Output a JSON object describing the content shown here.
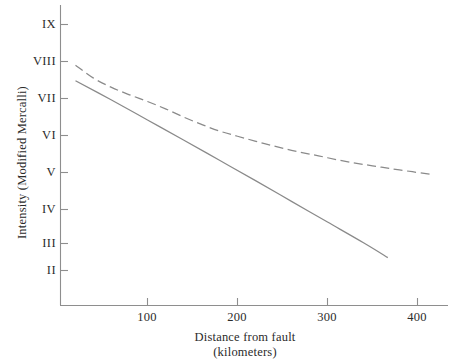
{
  "chart_data": {
    "type": "line",
    "title": "",
    "xlabel": "Distance from fault",
    "xlabel_units": "(kilometers)",
    "ylabel": "Intensity (Modified Mercalli)",
    "xlim": [
      0,
      431
    ],
    "ylim": [
      1.4,
      9.6
    ],
    "grid": false,
    "legend": "none",
    "xticks": [
      100,
      200,
      300,
      400
    ],
    "xtick_labels": [
      "100",
      "200",
      "300",
      "400"
    ],
    "yticks": [
      9,
      8,
      7,
      6,
      5,
      4,
      3,
      2
    ],
    "ytick_labels": [
      "IX",
      "VIII",
      "VII",
      "VI",
      "V",
      "IV",
      "III",
      "II"
    ],
    "series": [
      {
        "name": "upper-attenuation-curve",
        "style": "dashed",
        "color": "#8a8a8a",
        "points": [
          {
            "x": 20,
            "y": 7.9
          },
          {
            "x": 40,
            "y": 7.55
          },
          {
            "x": 60,
            "y": 7.3
          },
          {
            "x": 80,
            "y": 7.1
          },
          {
            "x": 100,
            "y": 6.92
          },
          {
            "x": 120,
            "y": 6.72
          },
          {
            "x": 140,
            "y": 6.5
          },
          {
            "x": 160,
            "y": 6.3
          },
          {
            "x": 180,
            "y": 6.12
          },
          {
            "x": 200,
            "y": 5.98
          },
          {
            "x": 230,
            "y": 5.78
          },
          {
            "x": 260,
            "y": 5.6
          },
          {
            "x": 290,
            "y": 5.45
          },
          {
            "x": 320,
            "y": 5.3
          },
          {
            "x": 350,
            "y": 5.18
          },
          {
            "x": 380,
            "y": 5.07
          },
          {
            "x": 415,
            "y": 4.95
          }
        ]
      },
      {
        "name": "lower-attenuation-curve",
        "style": "solid",
        "color": "#8a8a8a",
        "points": [
          {
            "x": 20,
            "y": 7.48
          },
          {
            "x": 60,
            "y": 6.96
          },
          {
            "x": 100,
            "y": 6.42
          },
          {
            "x": 140,
            "y": 5.88
          },
          {
            "x": 180,
            "y": 5.33
          },
          {
            "x": 220,
            "y": 4.78
          },
          {
            "x": 260,
            "y": 4.22
          },
          {
            "x": 300,
            "y": 3.66
          },
          {
            "x": 340,
            "y": 3.1
          },
          {
            "x": 367,
            "y": 2.7
          }
        ]
      }
    ]
  }
}
